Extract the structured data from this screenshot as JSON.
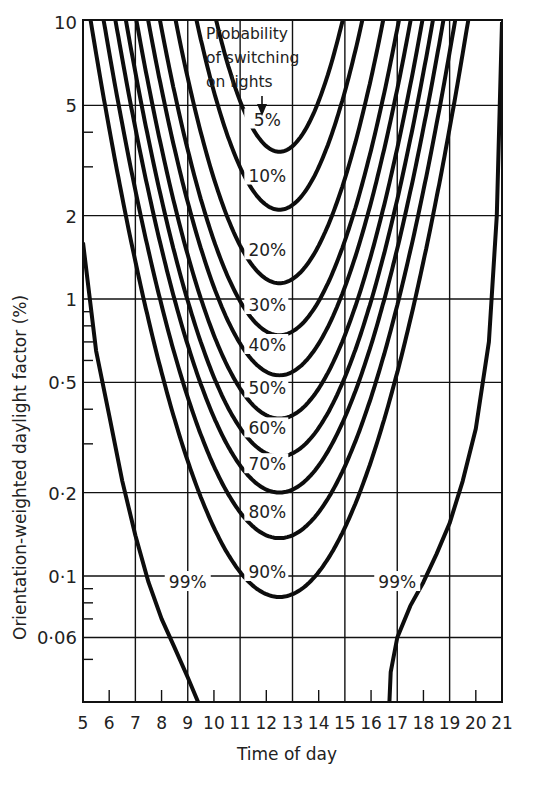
{
  "chart_data": {
    "type": "line",
    "title": "",
    "xlabel": "Time of day",
    "ylabel": "Orientation-weighted daylight factor (%)",
    "xlim": [
      5,
      21
    ],
    "ylim": [
      0.035,
      10
    ],
    "yscale": "log",
    "x_ticks": [
      5,
      6,
      7,
      8,
      9,
      10,
      11,
      12,
      13,
      14,
      15,
      16,
      17,
      18,
      19,
      20,
      21
    ],
    "x_gridlines": [
      7,
      9,
      11,
      13,
      15,
      17,
      19,
      21
    ],
    "y_tick_labels": [
      {
        "value": 10,
        "label": "10"
      },
      {
        "value": 5,
        "label": "5"
      },
      {
        "value": 2,
        "label": "2"
      },
      {
        "value": 1,
        "label": "1"
      },
      {
        "value": 0.5,
        "label": "0·5"
      },
      {
        "value": 0.2,
        "label": "0·2"
      },
      {
        "value": 0.1,
        "label": "0·1"
      },
      {
        "value": 0.06,
        "label": "0·06"
      }
    ],
    "y_minor_ticks": [
      4,
      3,
      0.9,
      0.8,
      0.7,
      0.6,
      0.4,
      0.3,
      0.09,
      0.08,
      0.07,
      0.05
    ],
    "grid": true,
    "annotation": "Probability of switching on lights",
    "series": [
      {
        "name": "5%",
        "label_at": [
          12,
          4.3
        ],
        "min_x": 12.5,
        "min_y": 3.4,
        "half_width_at_top": 2.4
      },
      {
        "name": "10%",
        "label_at": [
          12,
          2.7
        ],
        "min_x": 12.5,
        "min_y": 2.1,
        "half_width_at_top": 3.15
      },
      {
        "name": "20%",
        "label_at": [
          12,
          1.45
        ],
        "min_x": 12.5,
        "min_y": 1.14,
        "half_width_at_top": 3.95
      },
      {
        "name": "30%",
        "label_at": [
          12,
          0.92
        ],
        "min_x": 12.5,
        "min_y": 0.74,
        "half_width_at_top": 4.55
      },
      {
        "name": "40%",
        "label_at": [
          12,
          0.66
        ],
        "min_x": 12.5,
        "min_y": 0.53,
        "half_width_at_top": 5.0
      },
      {
        "name": "50%",
        "label_at": [
          12,
          0.46
        ],
        "min_x": 12.5,
        "min_y": 0.37,
        "half_width_at_top": 5.45
      },
      {
        "name": "60%",
        "label_at": [
          12,
          0.33
        ],
        "min_x": 12.5,
        "min_y": 0.27,
        "half_width_at_top": 5.85
      },
      {
        "name": "70%",
        "label_at": [
          12,
          0.245
        ],
        "min_x": 12.5,
        "min_y": 0.2,
        "half_width_at_top": 6.25
      },
      {
        "name": "80%",
        "label_at": [
          12,
          0.165
        ],
        "min_x": 12.5,
        "min_y": 0.137,
        "half_width_at_top": 6.7
      },
      {
        "name": "90%",
        "label_at": [
          12,
          0.1
        ],
        "min_x": 12.5,
        "min_y": 0.084,
        "half_width_at_top": 7.2
      }
    ],
    "series_99": [
      {
        "name": "99%",
        "side": "morning",
        "label_at": [
          9,
          0.092
        ],
        "points": [
          [
            5.0,
            1.6
          ],
          [
            5.5,
            0.65
          ],
          [
            6.0,
            0.38
          ],
          [
            6.5,
            0.22
          ],
          [
            7.0,
            0.14
          ],
          [
            7.5,
            0.095
          ],
          [
            8.0,
            0.07
          ],
          [
            8.5,
            0.055
          ],
          [
            9.0,
            0.043
          ],
          [
            9.4,
            0.035
          ]
        ]
      },
      {
        "name": "99%",
        "side": "evening",
        "label_at": [
          17,
          0.092
        ],
        "points": [
          [
            16.7,
            0.035
          ],
          [
            16.75,
            0.045
          ],
          [
            17.0,
            0.06
          ],
          [
            17.5,
            0.078
          ],
          [
            18.0,
            0.095
          ],
          [
            18.5,
            0.12
          ],
          [
            19.0,
            0.155
          ],
          [
            19.5,
            0.22
          ],
          [
            20.0,
            0.34
          ],
          [
            20.5,
            0.7
          ],
          [
            20.8,
            2.0
          ],
          [
            21.0,
            10
          ]
        ]
      }
    ]
  },
  "labels": {
    "ylabel": "Orientation-weighted daylight factor (%)",
    "xlabel": "Time of day",
    "prob_line1": "Probability",
    "prob_line2": "of switching",
    "prob_line3": "on lights"
  }
}
